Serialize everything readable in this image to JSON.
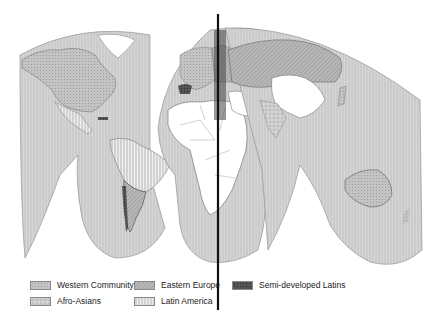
{
  "map": {
    "projection": "interrupted world map (Goode-style lobes)",
    "divider_line": {
      "x": 218,
      "y_start": 14,
      "y_end": 310,
      "color": "#111111"
    }
  },
  "legend": {
    "items": [
      {
        "label": "Western Community",
        "pattern": "western",
        "color": "#c8c8c8"
      },
      {
        "label": "Eastern Europe",
        "pattern": "eastern",
        "color": "#b4b4b4"
      },
      {
        "label": "Semi-developed Latins",
        "pattern": "semilatins",
        "color": "#555555"
      },
      {
        "label": "Afro-Asians",
        "pattern": "afroasian",
        "color": "#d4d4d4"
      },
      {
        "label": "Latin America",
        "pattern": "latam",
        "color": "#e2e2e2"
      }
    ]
  },
  "regions": {
    "white_unclassified": [
      "Africa",
      "Middle East",
      "China/Mongolia",
      "Greenland"
    ]
  }
}
